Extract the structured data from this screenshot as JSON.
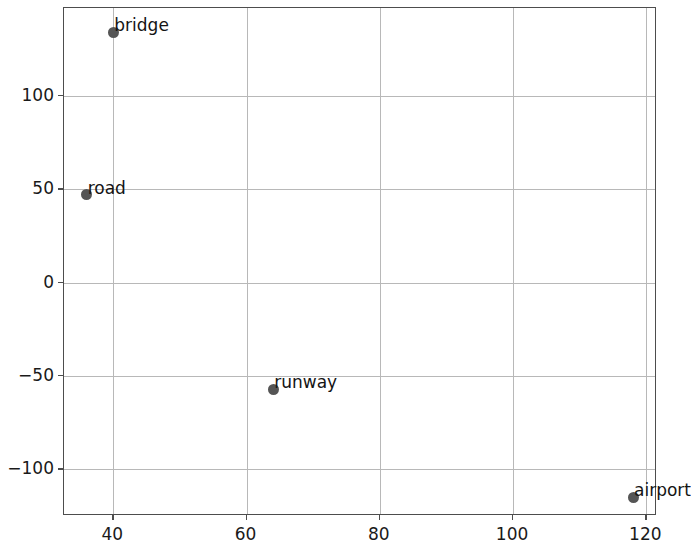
{
  "chart_data": {
    "type": "scatter",
    "title": "",
    "xlabel": "",
    "ylabel": "",
    "xlim": [
      32.6,
      121.6
    ],
    "ylim": [
      -125.0,
      147.0
    ],
    "grid": true,
    "legend": null,
    "marker_color": "#555555",
    "points": [
      {
        "label": "bridge",
        "x": 40,
        "y": 134
      },
      {
        "label": "road",
        "x": 36,
        "y": 47
      },
      {
        "label": "runway",
        "x": 64,
        "y": -57
      },
      {
        "label": "airport",
        "x": 118,
        "y": -115
      }
    ],
    "xticks": [
      40,
      60,
      80,
      100,
      120
    ],
    "xticklabels": [
      "40",
      "60",
      "80",
      "100",
      "120"
    ],
    "yticks": [
      -100,
      -50,
      0,
      50,
      100
    ],
    "yticklabels": [
      "−100",
      "−50",
      "0",
      "50",
      "100"
    ]
  }
}
